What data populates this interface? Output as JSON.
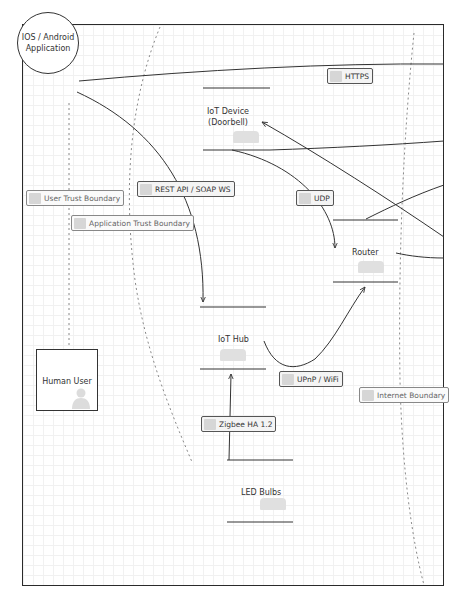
{
  "diagram": {
    "type": "threat-model-data-flow",
    "nodes": {
      "app": {
        "label_line1": "IOS / Android",
        "label_line2": "Application",
        "kind": "process"
      },
      "human_user": {
        "label": "Human User",
        "kind": "external-entity"
      },
      "iot_device": {
        "label_line1": "IoT Device",
        "label_line2": "(Doorbell)",
        "kind": "data-store"
      },
      "router": {
        "label": "Router",
        "kind": "data-store"
      },
      "iot_hub": {
        "label": "IoT Hub",
        "kind": "data-store"
      },
      "led_bulbs": {
        "label": "LED Bulbs",
        "kind": "data-store"
      }
    },
    "flows": {
      "https": "HTTPS",
      "rest": "REST API / SOAP WS",
      "udp": "UDP",
      "upnp": "UPnP / WiFi",
      "zigbee": "Zigbee HA 1.2"
    },
    "boundaries": {
      "user": "User Trust Boundary",
      "application": "Application Trust Boundary",
      "internet": "Internet Boundary"
    },
    "colors": {
      "line": "#333333",
      "boundary": "#888888",
      "grid": "#f1f1f1"
    }
  }
}
